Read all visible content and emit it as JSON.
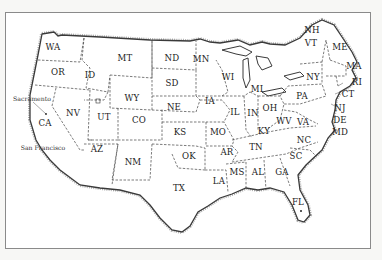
{
  "map": {
    "title": "United States map",
    "colors": {
      "background": "#ffffff",
      "border": "#8a8a8a",
      "coast": "#3a3a3a",
      "state_line": "#444444",
      "text": "#222222"
    },
    "states": [
      {
        "abbr": "WA",
        "x": 53,
        "y": 47
      },
      {
        "abbr": "OR",
        "x": 58,
        "y": 72
      },
      {
        "abbr": "ID",
        "x": 90,
        "y": 75
      },
      {
        "abbr": "MT",
        "x": 125,
        "y": 58
      },
      {
        "abbr": "ND",
        "x": 172,
        "y": 58
      },
      {
        "abbr": "MN",
        "x": 201,
        "y": 59
      },
      {
        "abbr": "SD",
        "x": 172,
        "y": 83
      },
      {
        "abbr": "WY",
        "x": 132,
        "y": 98
      },
      {
        "abbr": "NE",
        "x": 174,
        "y": 107
      },
      {
        "abbr": "NV",
        "x": 73,
        "y": 113
      },
      {
        "abbr": "UT",
        "x": 104,
        "y": 117
      },
      {
        "abbr": "CO",
        "x": 139,
        "y": 120
      },
      {
        "abbr": "KS",
        "x": 180,
        "y": 132
      },
      {
        "abbr": "CA",
        "x": 45,
        "y": 123
      },
      {
        "abbr": "AZ",
        "x": 97,
        "y": 149
      },
      {
        "abbr": "NM",
        "x": 133,
        "y": 162
      },
      {
        "abbr": "OK",
        "x": 189,
        "y": 156
      },
      {
        "abbr": "TX",
        "x": 179,
        "y": 188
      },
      {
        "abbr": "IA",
        "x": 210,
        "y": 101
      },
      {
        "abbr": "MO",
        "x": 218,
        "y": 132
      },
      {
        "abbr": "AR",
        "x": 227,
        "y": 152
      },
      {
        "abbr": "LA",
        "x": 219,
        "y": 181
      },
      {
        "abbr": "MS",
        "x": 237,
        "y": 172
      },
      {
        "abbr": "AL",
        "x": 258,
        "y": 172
      },
      {
        "abbr": "GA",
        "x": 282,
        "y": 172
      },
      {
        "abbr": "FL",
        "x": 298,
        "y": 202
      },
      {
        "abbr": "SC",
        "x": 296,
        "y": 156
      },
      {
        "abbr": "NC",
        "x": 304,
        "y": 140
      },
      {
        "abbr": "TN",
        "x": 256,
        "y": 147
      },
      {
        "abbr": "KY",
        "x": 264,
        "y": 131
      },
      {
        "abbr": "WV",
        "x": 284,
        "y": 121
      },
      {
        "abbr": "VA",
        "x": 303,
        "y": 122
      },
      {
        "abbr": "IL",
        "x": 235,
        "y": 112
      },
      {
        "abbr": "IN",
        "x": 253,
        "y": 113
      },
      {
        "abbr": "OH",
        "x": 270,
        "y": 108
      },
      {
        "abbr": "WI",
        "x": 228,
        "y": 77
      },
      {
        "abbr": "MI",
        "x": 257,
        "y": 89
      },
      {
        "abbr": "PA",
        "x": 302,
        "y": 96
      },
      {
        "abbr": "NY",
        "x": 313,
        "y": 77
      },
      {
        "abbr": "NH",
        "x": 312,
        "y": 30
      },
      {
        "abbr": "VT",
        "x": 311,
        "y": 43
      },
      {
        "abbr": "ME",
        "x": 340,
        "y": 47
      },
      {
        "abbr": "MA",
        "x": 354,
        "y": 66
      },
      {
        "abbr": "RI",
        "x": 357,
        "y": 82
      },
      {
        "abbr": "CT",
        "x": 348,
        "y": 94
      },
      {
        "abbr": "NJ",
        "x": 340,
        "y": 108
      },
      {
        "abbr": "DE",
        "x": 340,
        "y": 120
      },
      {
        "abbr": "MD",
        "x": 340,
        "y": 132
      }
    ],
    "cities": [
      {
        "name": "Sacramento",
        "x": 32,
        "y": 98
      },
      {
        "name": "San Francisco",
        "x": 43,
        "y": 147
      }
    ]
  }
}
